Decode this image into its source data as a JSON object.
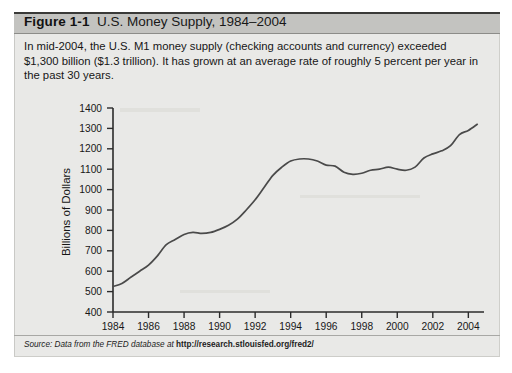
{
  "figure": {
    "label": "Figure 1-1",
    "title": "U.S. Money Supply, 1984–2004",
    "caption": "In mid-2004, the U.S. M1 money supply (checking accounts and currency) exceeded $1,300 billion ($1.3 trillion). It has grown at an average rate of roughly 5 percent per year in the past 30 years.",
    "source_prefix": "Source: Data from the FRED database at ",
    "source_url": "http://research.stlouisfed.org/fred2/"
  },
  "colors": {
    "panel_background": "#e9e9e7",
    "title_background": "#c3c3c0",
    "rule": "#3a3a38",
    "line": "#4a4a4a",
    "axis": "#2b2b2b",
    "text": "#161616"
  },
  "chart_data": {
    "type": "line",
    "title": "U.S. Money Supply, 1984–2004",
    "xlabel": "",
    "ylabel": "Billions of Dollars",
    "xlim": [
      1984,
      2004.6
    ],
    "ylim": [
      400,
      1400
    ],
    "xticks": [
      1984,
      1986,
      1988,
      1990,
      1992,
      1994,
      1996,
      1998,
      2000,
      2002,
      2004
    ],
    "xtick_labels": [
      "1984",
      "1986",
      "1988",
      "1990",
      "1992",
      "1994",
      "1996",
      "1998",
      "2000",
      "2002",
      "2004"
    ],
    "yticks": [
      400,
      500,
      600,
      700,
      800,
      900,
      1000,
      1100,
      1200,
      1300,
      1400
    ],
    "ytick_labels": [
      "400",
      "500",
      "600",
      "700",
      "800",
      "900",
      "1000",
      "1100",
      "1200",
      "1300",
      "1400"
    ],
    "grid": false,
    "legend": false,
    "series": [
      {
        "name": "M1 money supply",
        "x": [
          1984.0,
          1984.5,
          1985.0,
          1985.5,
          1986.0,
          1986.5,
          1987.0,
          1987.5,
          1988.0,
          1988.5,
          1989.0,
          1989.5,
          1990.0,
          1990.5,
          1991.0,
          1991.5,
          1992.0,
          1992.5,
          1993.0,
          1993.5,
          1994.0,
          1994.5,
          1995.0,
          1995.5,
          1996.0,
          1996.5,
          1997.0,
          1997.5,
          1998.0,
          1998.5,
          1999.0,
          1999.5,
          2000.0,
          2000.5,
          2001.0,
          2001.5,
          2002.0,
          2002.5,
          2003.0,
          2003.5,
          2004.0,
          2004.5
        ],
        "y": [
          525,
          540,
          570,
          600,
          630,
          675,
          730,
          755,
          780,
          790,
          785,
          790,
          805,
          825,
          855,
          900,
          950,
          1010,
          1070,
          1110,
          1140,
          1150,
          1150,
          1140,
          1120,
          1115,
          1085,
          1075,
          1080,
          1095,
          1100,
          1110,
          1100,
          1095,
          1110,
          1155,
          1175,
          1190,
          1215,
          1270,
          1290,
          1320
        ]
      }
    ]
  }
}
